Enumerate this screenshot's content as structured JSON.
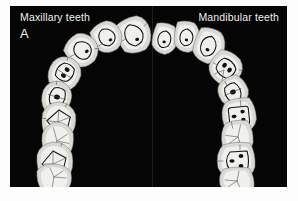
{
  "figure": {
    "panel_letter": "A",
    "background_color": "#050505",
    "page_color": "#fdfdfd",
    "tooth_color": "#d8d8d4",
    "label_color": "#f2f2f2",
    "outline_color": "#131313"
  },
  "labels": {
    "left": "Maxillary teeth",
    "right": "Mandibular teeth"
  },
  "arches": [
    {
      "name": "maxillary",
      "side": "left",
      "label": "Maxillary teeth",
      "tooth_count": 9,
      "teeth": [
        {
          "index": 1,
          "type": "central-incisor",
          "cx": 124,
          "cy": 29,
          "rx": 17,
          "ry": 19,
          "rot": -14,
          "prep": "triangular"
        },
        {
          "index": 2,
          "type": "lateral-incisor",
          "cx": 97,
          "cy": 31,
          "rx": 15,
          "ry": 17,
          "rot": -24,
          "prep": "triangular"
        },
        {
          "index": 3,
          "type": "canine",
          "cx": 72,
          "cy": 44,
          "rx": 16,
          "ry": 17,
          "rot": -38,
          "prep": "oval"
        },
        {
          "index": 4,
          "type": "first-premolar",
          "cx": 55,
          "cy": 67,
          "rx": 16,
          "ry": 16,
          "rot": -58,
          "prep": "oval-two-pit"
        },
        {
          "index": 5,
          "type": "second-premolar",
          "cx": 47,
          "cy": 91,
          "rx": 16,
          "ry": 15,
          "rot": -74,
          "prep": "oval-single"
        },
        {
          "index": 6,
          "type": "first-molar",
          "cx": 49,
          "cy": 114,
          "rx": 18,
          "ry": 16,
          "rot": -84,
          "prep": "rhomboid"
        },
        {
          "index": 7,
          "type": "second-molar",
          "cx": 48,
          "cy": 134,
          "rx": 18,
          "ry": 15,
          "rot": -88,
          "prep": "none"
        },
        {
          "index": 8,
          "type": "third-molar",
          "cx": 45,
          "cy": 155,
          "rx": 19,
          "ry": 16,
          "rot": -90,
          "prep": "rhomboid"
        },
        {
          "index": 9,
          "type": "distal-molar",
          "cx": 45,
          "cy": 172,
          "rx": 19,
          "ry": 13,
          "rot": -90,
          "prep": "none"
        }
      ]
    },
    {
      "name": "mandibular",
      "side": "right",
      "label": "Mandibular teeth",
      "tooth_count": 9,
      "teeth": [
        {
          "index": 1,
          "type": "central-incisor",
          "cx": 155,
          "cy": 33,
          "rx": 13,
          "ry": 15,
          "rot": 16,
          "prep": "oval"
        },
        {
          "index": 2,
          "type": "lateral-incisor",
          "cx": 177,
          "cy": 31,
          "rx": 13,
          "ry": 15,
          "rot": 10,
          "prep": "oval"
        },
        {
          "index": 3,
          "type": "canine",
          "cx": 199,
          "cy": 40,
          "rx": 15,
          "ry": 16,
          "rot": 22,
          "prep": "oval"
        },
        {
          "index": 4,
          "type": "first-premolar",
          "cx": 216,
          "cy": 62,
          "rx": 16,
          "ry": 16,
          "rot": 44,
          "prep": "oval-two-pit"
        },
        {
          "index": 5,
          "type": "second-premolar",
          "cx": 223,
          "cy": 86,
          "rx": 15,
          "ry": 15,
          "rot": 66,
          "prep": "oval-single"
        },
        {
          "index": 6,
          "type": "first-molar",
          "cx": 229,
          "cy": 110,
          "rx": 18,
          "ry": 16,
          "rot": 84,
          "prep": "rectangular"
        },
        {
          "index": 7,
          "type": "second-molar",
          "cx": 227,
          "cy": 132,
          "rx": 18,
          "ry": 15,
          "rot": 88,
          "prep": "none"
        },
        {
          "index": 8,
          "type": "third-molar",
          "cx": 226,
          "cy": 155,
          "rx": 19,
          "ry": 17,
          "rot": 90,
          "prep": "rectangular-wide"
        },
        {
          "index": 9,
          "type": "distal-molar",
          "cx": 226,
          "cy": 174,
          "rx": 19,
          "ry": 12,
          "rot": 90,
          "prep": "none"
        }
      ]
    }
  ]
}
